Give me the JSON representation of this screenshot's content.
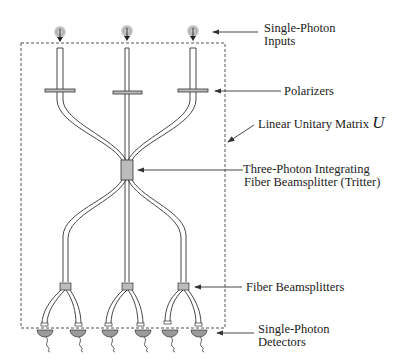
{
  "diagram": {
    "labels": {
      "inputs_line1": "Single-Photon",
      "inputs_line2": "Inputs",
      "polarizers": "Polarizers",
      "unitary": "Linear Unitary Matrix",
      "unitary_symbol": "U",
      "tritter_line1": "Three-Photon Integrating",
      "tritter_line2": "Fiber Beamsplitter (Tritter)",
      "beamsplitters": "Fiber Beamsplitters",
      "detectors_line1": "Single-Photon",
      "detectors_line2": "Detectors"
    },
    "components": {
      "inputs": [
        "photon-source-1",
        "photon-source-2",
        "photon-source-3"
      ],
      "polarizers": [
        "polarizer-1",
        "polarizer-2",
        "polarizer-3"
      ],
      "tritter": "tritter",
      "fiber_beamsplitters": [
        "fiber-beamsplitter-1",
        "fiber-beamsplitter-2",
        "fiber-beamsplitter-3"
      ],
      "detectors": [
        "detector-1",
        "detector-2",
        "detector-3",
        "detector-4",
        "detector-5",
        "detector-6"
      ]
    },
    "colors": {
      "line": "#333333",
      "fill_gray": "#b8b8b8",
      "detector_fill": "#9a9a9a",
      "photon_glow": "#c8c8c8"
    }
  }
}
